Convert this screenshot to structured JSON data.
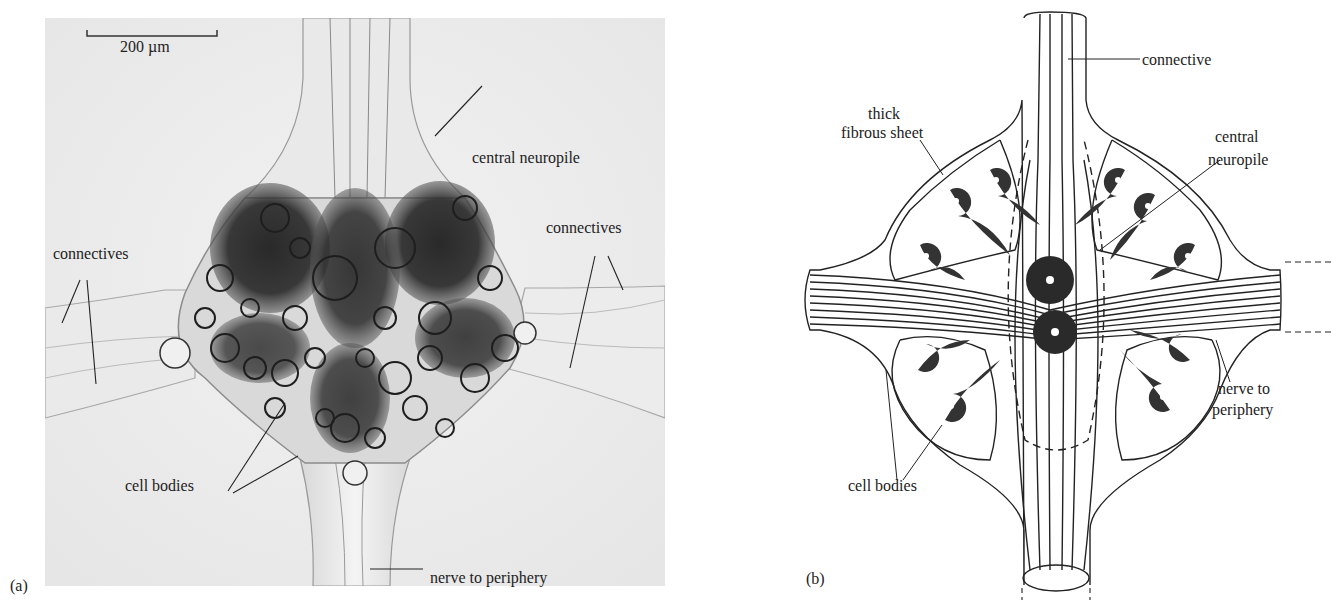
{
  "figure": {
    "panels": [
      {
        "id": "a",
        "tag": "(a)",
        "type": "micrograph",
        "scale_bar": {
          "label": "200 µm"
        },
        "labels": {
          "central_neuropile": "central neuropile",
          "connectives_left": "connectives",
          "connectives_right": "connectives",
          "cell_bodies": "cell bodies",
          "nerve_to_periphery": "nerve to periphery"
        }
      },
      {
        "id": "b",
        "tag": "(b)",
        "type": "schematic-drawing",
        "labels": {
          "connective": "connective",
          "thick_fibrous_sheet_1": "thick",
          "thick_fibrous_sheet_2": "fibrous sheet",
          "central_neuropile_1": "central",
          "central_neuropile_2": "neuropile",
          "nerve_to_periphery_1": "nerve to",
          "nerve_to_periphery_2": "periphery",
          "cell_bodies": "cell bodies"
        }
      }
    ],
    "colors": {
      "background": "#ffffff",
      "ink": "#222222",
      "photo_bg": "#eeeeee",
      "stain": "#1c1c1c"
    }
  }
}
